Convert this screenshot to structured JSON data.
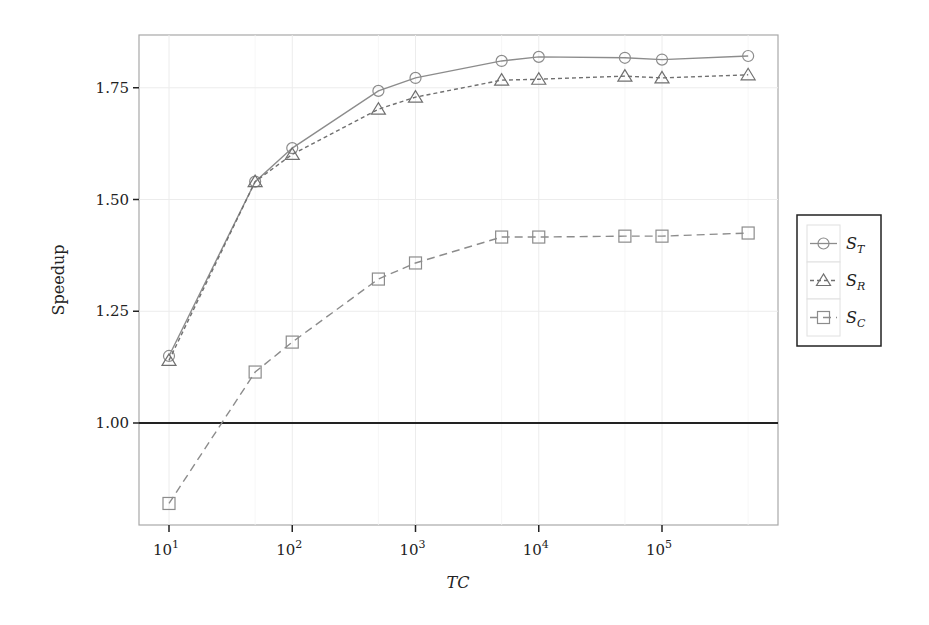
{
  "chart_data": {
    "type": "line",
    "title": "",
    "xlabel": "TC",
    "ylabel": "Speedup",
    "xscale": "log10",
    "x": [
      10,
      50,
      100,
      500,
      1000,
      5000,
      10000,
      50000,
      100000,
      500000
    ],
    "x_ticks": [
      10,
      100,
      1000,
      10000,
      100000
    ],
    "x_tick_labels": [
      {
        "base": "10",
        "exp": "1"
      },
      {
        "base": "10",
        "exp": "2"
      },
      {
        "base": "10",
        "exp": "3"
      },
      {
        "base": "10",
        "exp": "4"
      },
      {
        "base": "10",
        "exp": "5"
      }
    ],
    "y_ticks": [
      1.0,
      1.25,
      1.5,
      1.75
    ],
    "y_tick_labels": [
      "1.00",
      "1.25",
      "1.50",
      "1.75"
    ],
    "ylim": [
      0.78,
      1.86
    ],
    "grid": true,
    "reference_line": {
      "y": 1.0,
      "color": "#222222"
    },
    "legend_position": "right",
    "series": [
      {
        "name": "S_T",
        "label_main": "S",
        "label_sub": "T",
        "marker": "circle",
        "linestyle": "solid",
        "color": "#8c8c8c",
        "values": [
          1.15,
          1.54,
          1.615,
          1.743,
          1.772,
          1.81,
          1.819,
          1.817,
          1.813,
          1.821
        ]
      },
      {
        "name": "S_R",
        "label_main": "S",
        "label_sub": "R",
        "marker": "triangle",
        "linestyle": "dashed-short",
        "color": "#707070",
        "values": [
          1.14,
          1.54,
          1.601,
          1.702,
          1.729,
          1.767,
          1.769,
          1.776,
          1.772,
          1.779
        ]
      },
      {
        "name": "S_C",
        "label_main": "S",
        "label_sub": "C",
        "marker": "square",
        "linestyle": "dashed-long",
        "color": "#8c8c8c",
        "values": [
          0.82,
          1.114,
          1.181,
          1.322,
          1.358,
          1.416,
          1.416,
          1.418,
          1.418,
          1.425
        ]
      }
    ]
  }
}
